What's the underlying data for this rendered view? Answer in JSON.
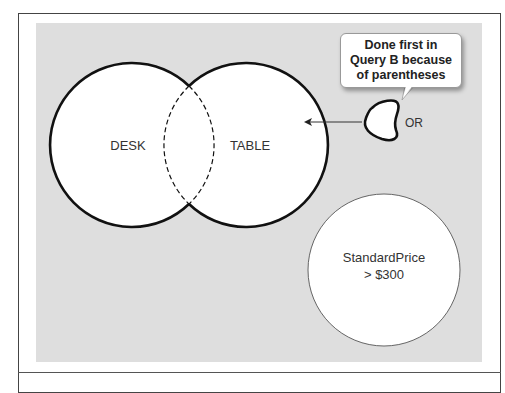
{
  "diagram": {
    "circles": [
      {
        "id": "desk",
        "label": "DESK"
      },
      {
        "id": "table",
        "label": "TABLE"
      },
      {
        "id": "standard-price",
        "label_line1": "StandardPrice",
        "label_line2": "> $300"
      }
    ],
    "operator_label": "OR",
    "callout": {
      "line1": "Done first in",
      "line2": "Query B because",
      "line3": "of parentheses"
    },
    "colors": {
      "panel": "#dedede",
      "circle_fill": "#ffffff",
      "stroke": "#111111",
      "text": "#333333"
    }
  }
}
